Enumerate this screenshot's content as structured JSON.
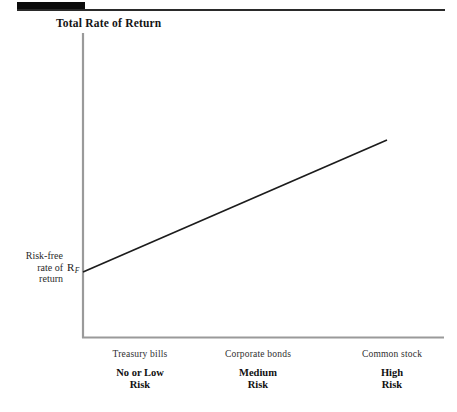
{
  "figure": {
    "title": "Total Rate of Return",
    "y_axis_caption_lines": [
      "Risk-free",
      "rate of",
      "return"
    ],
    "y_intercept_symbol": "R",
    "y_intercept_subscript": "F",
    "line_color": "#1c1c1c",
    "axis_color": "#9a9a9a",
    "rule_color": "#2a2a2a",
    "background_color": "#ffffff"
  },
  "chart_data": {
    "type": "line",
    "title": "Total Rate of Return",
    "xlabel": "",
    "ylabel": "Total Rate of Return",
    "grid": false,
    "legend": "none",
    "annotations": [
      "R_F"
    ],
    "categories": [
      "Treasury bills",
      "Corporate bonds",
      "Common stock"
    ],
    "risk_levels": [
      "No or Low\nRisk",
      "Medium\nRisk",
      "High\nRisk"
    ],
    "x": [
      0,
      1,
      2
    ],
    "series": [
      {
        "name": "Total rate of return",
        "values": [
          0.18,
          0.52,
          0.86
        ],
        "description": "Straight upward-sloping risk-return line beginning at the risk-free rate on the vertical axis"
      }
    ],
    "xlim": [
      0,
      2
    ],
    "ylim": [
      0,
      1
    ],
    "axis_ticks": "none",
    "line_start": {
      "x_px": 83,
      "y_px": 272
    },
    "line_end": {
      "x_px": 387,
      "y_px": 140
    }
  },
  "axis_labels": [
    {
      "category": "Treasury bills",
      "risk_line1": "No or Low",
      "risk_line2": "Risk"
    },
    {
      "category": "Corporate bonds",
      "risk_line1": "Medium",
      "risk_line2": "Risk"
    },
    {
      "category": "Common stock",
      "risk_line1": "High",
      "risk_line2": "Risk"
    }
  ]
}
